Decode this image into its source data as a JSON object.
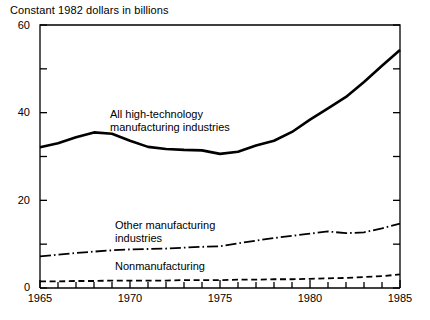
{
  "chart_data": {
    "type": "line",
    "title": "Constant 1982 dollars in billions",
    "xlabel": "",
    "ylabel": "",
    "xlim": [
      1965,
      1985
    ],
    "ylim": [
      0,
      60
    ],
    "grid": false,
    "legend_position": "inline-annotations",
    "y_major_ticks": [
      0,
      20,
      40,
      60
    ],
    "y_major_tick_labels": [
      "0",
      "20",
      "40",
      "60"
    ],
    "y_minor_ticks": [
      10,
      30,
      50
    ],
    "x_major_ticks": [
      1965,
      1970,
      1975,
      1980,
      1985
    ],
    "x_major_tick_labels": [
      "1965",
      "1970",
      "1975",
      "1980",
      "1985"
    ],
    "x_minor_ticks": [
      1966,
      1967,
      1968,
      1969,
      1971,
      1972,
      1973,
      1974,
      1976,
      1977,
      1978,
      1979,
      1981,
      1982,
      1983,
      1984
    ],
    "x": [
      1965,
      1966,
      1967,
      1968,
      1969,
      1970,
      1971,
      1972,
      1973,
      1974,
      1975,
      1976,
      1977,
      1978,
      1979,
      1980,
      1981,
      1982,
      1983,
      1984,
      1985
    ],
    "series": [
      {
        "name": "All high-technology manufacturing industries",
        "style": "solid",
        "width": 2.6,
        "color": "#000000",
        "values": [
          32.1,
          33.0,
          34.4,
          35.5,
          35.2,
          33.6,
          32.2,
          31.7,
          31.5,
          31.4,
          30.6,
          31.1,
          32.5,
          33.6,
          35.6,
          38.4,
          41.0,
          43.6,
          47.0,
          50.7,
          54.3
        ]
      },
      {
        "name": "Other manufacturing industries",
        "style": "dash-dot",
        "width": 1.8,
        "color": "#000000",
        "values": [
          7.2,
          7.6,
          8.0,
          8.3,
          8.6,
          8.8,
          8.9,
          9.0,
          9.2,
          9.4,
          9.5,
          10.2,
          10.8,
          11.4,
          11.9,
          12.4,
          12.9,
          12.5,
          12.7,
          13.6,
          14.7
        ]
      },
      {
        "name": "Nonmanufacturing",
        "style": "dashed",
        "width": 1.8,
        "color": "#000000",
        "values": [
          1.5,
          1.5,
          1.6,
          1.6,
          1.7,
          1.7,
          1.7,
          1.7,
          1.8,
          1.8,
          1.8,
          1.9,
          1.9,
          2.0,
          2.0,
          2.1,
          2.2,
          2.3,
          2.5,
          2.7,
          3.1
        ]
      }
    ],
    "annotations": [
      {
        "id": "hightech",
        "text_line1": "All high-technology",
        "text_line2": "manufacturing industries"
      },
      {
        "id": "othermfg",
        "text_line1": "Other manufacturing",
        "text_line2": "industries"
      },
      {
        "id": "nonmfg",
        "text_line1": "Nonmanufacturing",
        "text_line2": ""
      }
    ]
  },
  "axis": {
    "y_labels": [
      "60",
      "40",
      "20",
      "0"
    ],
    "x_labels": [
      "1965",
      "1970",
      "1975",
      "1980",
      "1985"
    ]
  }
}
